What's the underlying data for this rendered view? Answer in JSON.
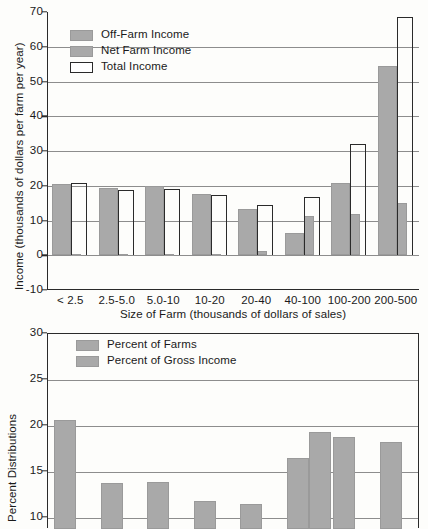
{
  "chart_data": [
    {
      "id": "income-by-farm-size",
      "type": "bar",
      "title": "",
      "xlabel": "Size of Farm (thousands of dollars of sales)",
      "ylabel": "Income (thousands of dollars per farm per year)",
      "categories": [
        "< 2.5",
        "2.5-5.0",
        "5.0-10",
        "10-20",
        "20-40",
        "40-100",
        "100-200",
        "200-500"
      ],
      "ylim": [
        -10,
        70
      ],
      "yticks": [
        -10,
        0,
        10,
        20,
        30,
        40,
        50,
        60,
        70
      ],
      "grid": true,
      "legend_position": "top-left",
      "series": [
        {
          "name": "Off-Farm Income",
          "style": "filled",
          "values": [
            20.6,
            19.3,
            19.8,
            17.6,
            13.3,
            6.3,
            20.8,
            54.6
          ]
        },
        {
          "name": "Net Farm Income",
          "style": "filled",
          "values": [
            0.3,
            0.3,
            0.4,
            0.5,
            1.2,
            11.3,
            12.0,
            14.9
          ]
        },
        {
          "name": "Total Income",
          "style": "outline",
          "values": [
            20.8,
            18.9,
            19.0,
            17.2,
            14.4,
            16.9,
            31.9,
            68.6
          ]
        }
      ]
    },
    {
      "id": "percent-distributions-by-farm-size",
      "type": "bar",
      "title": "",
      "xlabel": "",
      "ylabel": "Percent Distributions",
      "categories": [
        "< 2.5",
        "2.5-5.0",
        "5.0-10",
        "10-20",
        "20-40",
        "40-100",
        "100-200",
        "200-500"
      ],
      "ylim": [
        8.8,
        30
      ],
      "yticks": [
        10,
        15,
        20,
        25,
        30
      ],
      "grid": true,
      "legend_position": "top-left",
      "note": "lower chart is cropped at the bottom edge of the screenshot",
      "series": [
        {
          "name": "Percent of Farms",
          "style": "filled",
          "values": [
            20.6,
            13.8,
            13.9,
            11.8,
            11.5,
            16.5,
            18.8,
            18.3,
            28.2
          ]
        },
        {
          "name": "Percent of Gross Income",
          "style": "filled",
          "values": [
            null,
            null,
            null,
            null,
            null,
            19.4,
            null,
            null,
            null
          ]
        }
      ]
    }
  ]
}
